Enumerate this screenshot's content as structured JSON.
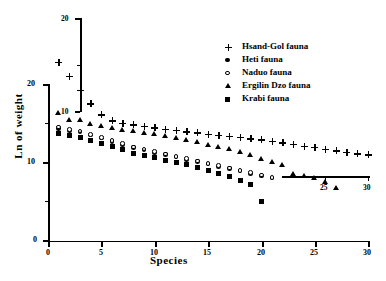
{
  "chart_data": {
    "type": "scatter",
    "title": "",
    "xlabel": "Species",
    "ylabel": "Ln of weight",
    "xlim": [
      0,
      30
    ],
    "ylim": [
      0,
      20
    ],
    "xticks": [
      0,
      5,
      10,
      15,
      20,
      25,
      30
    ],
    "yticks": [
      0,
      10,
      20
    ],
    "xtick_labels": [
      "0",
      "5",
      "10",
      "15",
      "20",
      "25",
      "30"
    ],
    "ytick_labels": [
      "0",
      "10",
      "20"
    ],
    "grid": false,
    "legend_position": "upper right",
    "series": [
      {
        "name": "Hsand-Gol fauna",
        "marker": "plus",
        "x": [
          1,
          2,
          3,
          4,
          5,
          6,
          7,
          8,
          9,
          10,
          11,
          12,
          13,
          14,
          15,
          16,
          17,
          18,
          19,
          20,
          21,
          22,
          23,
          24,
          25,
          26,
          27,
          28,
          29,
          30
        ],
        "y": [
          22.8,
          21.0,
          19.2,
          17.5,
          16.1,
          15.3,
          15.0,
          14.8,
          14.6,
          14.4,
          14.2,
          14.1,
          13.9,
          13.8,
          13.6,
          13.5,
          13.3,
          13.2,
          13.0,
          12.9,
          12.7,
          12.5,
          12.3,
          12.1,
          11.9,
          11.7,
          11.5,
          11.3,
          11.1,
          11.0
        ]
      },
      {
        "name": "Heti fauna",
        "marker": "circle-filled",
        "x": [
          1,
          2,
          3,
          4,
          5,
          6,
          7,
          8,
          9,
          10,
          11,
          12,
          13,
          14,
          15,
          16,
          17,
          18,
          19,
          20,
          21
        ],
        "y": [
          14.3,
          14.1,
          13.9,
          13.5,
          13.1,
          12.7,
          12.3,
          11.9,
          11.6,
          11.3,
          11.0,
          10.7,
          10.4,
          10.1,
          9.8,
          9.5,
          9.2,
          8.9,
          8.6,
          8.3,
          8.0
        ]
      },
      {
        "name": "Naduo fauna",
        "marker": "circle-open",
        "x": [
          1,
          2,
          3,
          4,
          5,
          6,
          7,
          8,
          9,
          10,
          11,
          12,
          13,
          14,
          15,
          16,
          17,
          18,
          19,
          20,
          21
        ],
        "y": [
          14.5,
          14.2,
          14.0,
          13.6,
          13.2,
          12.8,
          12.4,
          12.0,
          11.7,
          11.4,
          11.1,
          10.8,
          10.5,
          10.2,
          9.9,
          9.6,
          9.3,
          9.0,
          8.7,
          8.4,
          8.1
        ]
      },
      {
        "name": "Ergilin Dzo fauna",
        "marker": "triangle",
        "x": [
          1,
          2,
          3,
          4,
          5,
          6,
          7,
          8,
          9,
          10,
          11,
          12,
          13,
          14,
          15,
          16,
          17,
          18,
          19,
          20,
          21,
          22,
          23,
          24,
          25,
          26,
          27
        ],
        "y": [
          16.3,
          15.5,
          15.4,
          14.9,
          14.7,
          14.4,
          14.2,
          14.0,
          13.8,
          13.6,
          13.4,
          13.2,
          12.9,
          12.6,
          12.3,
          12.0,
          11.7,
          11.4,
          11.0,
          10.5,
          10.1,
          9.7,
          8.6,
          8.3,
          8.0,
          7.6,
          6.8
        ]
      },
      {
        "name": "Krabi fauna",
        "marker": "square",
        "x": [
          1,
          2,
          3,
          4,
          5,
          6,
          7,
          8,
          9,
          10,
          11,
          12,
          13,
          14,
          15,
          16,
          17,
          18,
          19,
          20
        ],
        "y": [
          13.7,
          13.4,
          13.2,
          12.8,
          12.4,
          12.0,
          11.6,
          11.2,
          10.9,
          10.6,
          10.3,
          10.0,
          9.7,
          9.4,
          9.0,
          8.6,
          8.2,
          7.7,
          7.2,
          5.0
        ]
      }
    ]
  },
  "overlay_axes": {
    "inner_y_axis": {
      "tick_labels": [
        "20",
        "10"
      ],
      "note": "secondary y-axis fragment"
    },
    "inner_x_axis": {
      "tick_labels": [
        "25",
        "30"
      ],
      "note": "secondary x-axis fragment"
    }
  },
  "legend": {
    "items": [
      {
        "label": "Hsand-Gol fauna",
        "marker": "plus"
      },
      {
        "label": "Heti fauna",
        "marker": "circle-filled"
      },
      {
        "label": "Naduo fauna",
        "marker": "circle-open"
      },
      {
        "label": "Ergilin Dzo fauna",
        "marker": "triangle"
      },
      {
        "label": "Krabi fauna",
        "marker": "square"
      }
    ]
  }
}
